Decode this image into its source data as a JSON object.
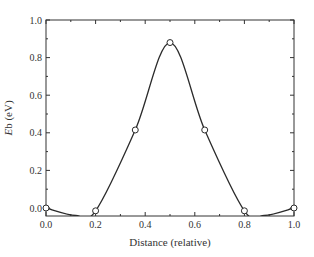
{
  "chart_data": {
    "type": "line",
    "title": "",
    "xlabel": "Distance (relative)",
    "ylabel_italic": "E",
    "ylabel_rest": "b (eV)",
    "ylabel": "Eb (eV)",
    "xlim": [
      0.0,
      1.0
    ],
    "ylim": [
      -0.04,
      1.0
    ],
    "x_ticks": [
      "0.0",
      "0.2",
      "0.4",
      "0.6",
      "0.8",
      "1.0"
    ],
    "y_ticks": [
      "0.0",
      "0.2",
      "0.4",
      "0.6",
      "0.8",
      "1.0"
    ],
    "grid": false,
    "legend": null,
    "series": [
      {
        "name": "Eb",
        "markers": "open-circle",
        "x": [
          0.0,
          0.2,
          0.36,
          0.5,
          0.64,
          0.8,
          1.0
        ],
        "y": [
          0.0,
          -0.015,
          0.415,
          0.88,
          0.415,
          -0.015,
          0.0
        ]
      }
    ],
    "curve_minima": [
      {
        "x": 0.12,
        "y": -0.04
      },
      {
        "x": 0.88,
        "y": -0.04
      }
    ]
  },
  "colors": {
    "line": "#2b2b2b",
    "axis": "#333333",
    "marker_fill": "#ffffff"
  }
}
